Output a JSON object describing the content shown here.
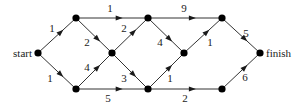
{
  "diagram": {
    "type": "weighted-directed-graph",
    "nodes": [
      {
        "id": "start",
        "label": "start",
        "x": 38,
        "y": 53
      },
      {
        "id": "a",
        "label": "",
        "x": 76,
        "y": 18
      },
      {
        "id": "b",
        "label": "",
        "x": 76,
        "y": 89
      },
      {
        "id": "c",
        "label": "",
        "x": 112,
        "y": 53
      },
      {
        "id": "d",
        "label": "",
        "x": 148,
        "y": 18
      },
      {
        "id": "e",
        "label": "",
        "x": 148,
        "y": 89
      },
      {
        "id": "f",
        "label": "",
        "x": 184,
        "y": 53
      },
      {
        "id": "g",
        "label": "",
        "x": 222,
        "y": 18
      },
      {
        "id": "h",
        "label": "",
        "x": 222,
        "y": 89
      },
      {
        "id": "finish",
        "label": "finish",
        "x": 260,
        "y": 53
      }
    ],
    "edges": [
      {
        "from": "start",
        "to": "a",
        "weight": "1",
        "lx": 52,
        "ly": 32
      },
      {
        "from": "start",
        "to": "b",
        "weight": "1",
        "lx": 50,
        "ly": 82
      },
      {
        "from": "a",
        "to": "d",
        "weight": "1",
        "lx": 110,
        "ly": 12
      },
      {
        "from": "a",
        "to": "c",
        "weight": "2",
        "lx": 87,
        "ly": 46
      },
      {
        "from": "b",
        "to": "c",
        "weight": "4",
        "lx": 87,
        "ly": 71
      },
      {
        "from": "b",
        "to": "e",
        "weight": "5",
        "lx": 108,
        "ly": 102
      },
      {
        "from": "c",
        "to": "d",
        "weight": "2",
        "lx": 124,
        "ly": 32
      },
      {
        "from": "c",
        "to": "e",
        "weight": "3",
        "lx": 124,
        "ly": 82
      },
      {
        "from": "d",
        "to": "g",
        "weight": "9",
        "lx": 184,
        "ly": 12
      },
      {
        "from": "d",
        "to": "f",
        "weight": "4",
        "lx": 160,
        "ly": 46
      },
      {
        "from": "e",
        "to": "f",
        "weight": "1",
        "lx": 170,
        "ly": 82
      },
      {
        "from": "e",
        "to": "h",
        "weight": "2",
        "lx": 185,
        "ly": 102
      },
      {
        "from": "f",
        "to": "g",
        "weight": "1",
        "lx": 210,
        "ly": 46
      },
      {
        "from": "g",
        "to": "finish",
        "weight": "5",
        "lx": 246,
        "ly": 37
      },
      {
        "from": "h",
        "to": "finish",
        "weight": "6",
        "lx": 245,
        "ly": 81
      }
    ]
  }
}
